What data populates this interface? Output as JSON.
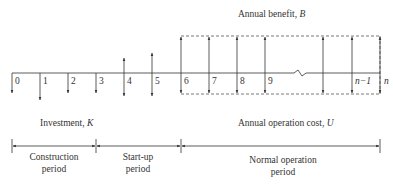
{
  "diagram": {
    "labels": {
      "annual_benefit": "Annual benefit, ",
      "annual_benefit_symbol": "B",
      "investment": "Investment, ",
      "investment_symbol": "K",
      "annual_cost": "Annual operation cost, ",
      "annual_cost_symbol": "U"
    },
    "ticks": [
      "0",
      "1",
      "2",
      "3",
      "4",
      "5",
      "6",
      "7",
      "8",
      "9",
      "",
      "n−1",
      "n"
    ],
    "periods": [
      {
        "line1": "Construction",
        "line2": "period"
      },
      {
        "line1": "Start-up",
        "line2": "period"
      },
      {
        "line1": "Normal operation",
        "line2": "period"
      }
    ],
    "colors": {
      "line": "#333333",
      "dashed": "#555555",
      "background": "#ffffff"
    }
  }
}
